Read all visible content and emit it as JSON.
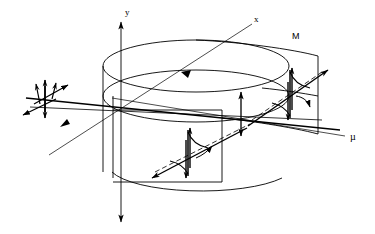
{
  "figure": {
    "background_color": "#ffffff",
    "stroke_color": "#000000",
    "width": 375,
    "height": 234
  },
  "labels": {
    "y_axis": "y",
    "x_axis": "x",
    "mu_axis": "µ",
    "surface_m": "M"
  },
  "axes": [
    {
      "name": "y-axis",
      "label": "y",
      "orientation": "vertical",
      "arrowheads": "both",
      "label_position": {
        "x": 124,
        "y": 14
      }
    },
    {
      "name": "x-axis",
      "label": "x",
      "orientation": "diagonal-up-right",
      "arrowheads": "mid-forward",
      "label_position": {
        "x": 256,
        "y": 21
      }
    },
    {
      "name": "mu-axis",
      "label": "µ",
      "orientation": "diagonal-right",
      "arrowheads": "none",
      "label_position": {
        "x": 352,
        "y": 138
      }
    }
  ],
  "surfaces": [
    {
      "name": "cylinder",
      "label": "",
      "description": "open circular cylinder with top rim, mid rim and bottom rim"
    },
    {
      "name": "m-sheet",
      "label": "M",
      "description": "curved rectangular sheet attached to the cylinder on the right",
      "label_position": {
        "x": 295,
        "y": 38
      }
    },
    {
      "name": "inner-sheet",
      "label": "",
      "description": "curved rectangular sheet inside the cylinder, lower left"
    }
  ],
  "spin_clusters": [
    {
      "name": "spin-cluster-left",
      "position": {
        "x": 44,
        "y": 100
      },
      "description": "vector star of arrows outside the cylinder on the left"
    },
    {
      "name": "spin-cluster-center",
      "position": {
        "x": 188,
        "y": 155
      },
      "description": "precession spiral with double lobes on the inner sheet"
    },
    {
      "name": "spin-cluster-right",
      "position": {
        "x": 290,
        "y": 95
      },
      "description": "precession spiral with double lobes on the M sheet"
    }
  ],
  "annotations": [
    {
      "name": "amplitude-double-arrow",
      "orientation": "vertical",
      "arrowheads": "both",
      "position": {
        "x": 241,
        "y": 113
      }
    }
  ]
}
